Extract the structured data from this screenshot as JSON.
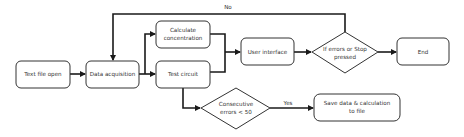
{
  "diagram": {
    "type": "flowchart",
    "colors": {
      "stroke": "#333333",
      "edge": "#1a1a1a",
      "fill": "#ffffff",
      "text": "#333333"
    },
    "nodes": {
      "text_file_open": {
        "shape": "rounded-rect",
        "line1": "Text file open"
      },
      "data_acquisition": {
        "shape": "rounded-rect",
        "line1": "Data acquisition"
      },
      "calculate_concentration": {
        "shape": "rounded-rect",
        "line1": "Calculate",
        "line2": "concentration"
      },
      "test_circuit": {
        "shape": "rounded-rect",
        "line1": "Test circuit"
      },
      "user_interface": {
        "shape": "rounded-rect",
        "line1": "User interface"
      },
      "errors_or_stop": {
        "shape": "diamond",
        "line1": "If errors or Stop",
        "line2": "pressed"
      },
      "end": {
        "shape": "rounded-rect",
        "line1": "End"
      },
      "consecutive_errors": {
        "shape": "diamond",
        "line1": "Consecutive",
        "line2": "errors < 50"
      },
      "save_data": {
        "shape": "rounded-rect",
        "line1": "Save data & calculation",
        "line2": "to file"
      }
    },
    "edges": [
      {
        "from": "text_file_open",
        "to": "data_acquisition",
        "label": ""
      },
      {
        "from": "data_acquisition",
        "to": "calculate_concentration",
        "label": ""
      },
      {
        "from": "data_acquisition",
        "to": "test_circuit",
        "label": ""
      },
      {
        "from": "calculate_concentration",
        "to": "user_interface",
        "label": ""
      },
      {
        "from": "test_circuit",
        "to": "user_interface",
        "label": ""
      },
      {
        "from": "user_interface",
        "to": "errors_or_stop",
        "label": ""
      },
      {
        "from": "errors_or_stop",
        "to": "end",
        "label": ""
      },
      {
        "from": "errors_or_stop",
        "to": "data_acquisition",
        "label": "No"
      },
      {
        "from": "test_circuit",
        "to": "consecutive_errors",
        "label": ""
      },
      {
        "from": "consecutive_errors",
        "to": "save_data",
        "label": "Yes"
      }
    ],
    "edge_labels": {
      "no": "No",
      "yes": "Yes"
    }
  }
}
